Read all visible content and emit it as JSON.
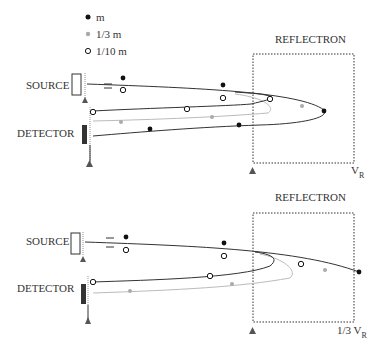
{
  "legend": {
    "items": [
      {
        "marker": "filled-dot",
        "label": "m",
        "color": "#111111"
      },
      {
        "marker": "gray-dot",
        "label": "1/3 m",
        "color": "#aaaaaa"
      },
      {
        "marker": "open-circle",
        "label": "1/10 m",
        "color": "#111111"
      }
    ]
  },
  "panels": [
    {
      "source_label": "SOURCE",
      "detector_label": "DETECTOR",
      "reflectron_label": "REFLECTRON",
      "voltage_label": "V",
      "voltage_sub": "R",
      "voltage_prefix": ""
    },
    {
      "source_label": "SOURCE",
      "detector_label": "DETECTOR",
      "reflectron_label": "REFLECTRON",
      "voltage_label": "V",
      "voltage_sub": "R",
      "voltage_prefix": "1/3 "
    }
  ],
  "colors": {
    "line_dark": "#333333",
    "line_gray": "#b0b0b0",
    "dot_dark": "#111111",
    "dot_gray": "#aaaaaa",
    "detector": "#333333",
    "ground": "#555555"
  }
}
